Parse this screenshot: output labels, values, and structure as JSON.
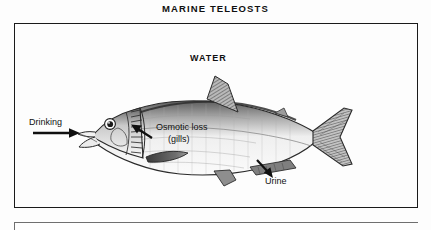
{
  "figure": {
    "title": "MARINE TELEOSTS"
  },
  "environment": {
    "medium_label": "WATER"
  },
  "labels": {
    "drinking": "Drinking",
    "osmotic_loss_line1": "Osmotic loss",
    "osmotic_loss_line2": "(gills)",
    "urine": "Urine"
  },
  "arrows": [
    {
      "name": "drinking-arrow",
      "direction": "right",
      "meaning": "water intake at mouth"
    },
    {
      "name": "osmotic-loss-arrow",
      "direction": "up-left",
      "meaning": "water lost across gills"
    },
    {
      "name": "urine-arrow",
      "direction": "down-right",
      "meaning": "urine excreted at vent"
    }
  ],
  "colors": {
    "ink": "#1a1a1a",
    "paper": "#fdfdfd",
    "fish_shade": "#8d8d8d",
    "fin_shade": "#6f6f6f"
  }
}
